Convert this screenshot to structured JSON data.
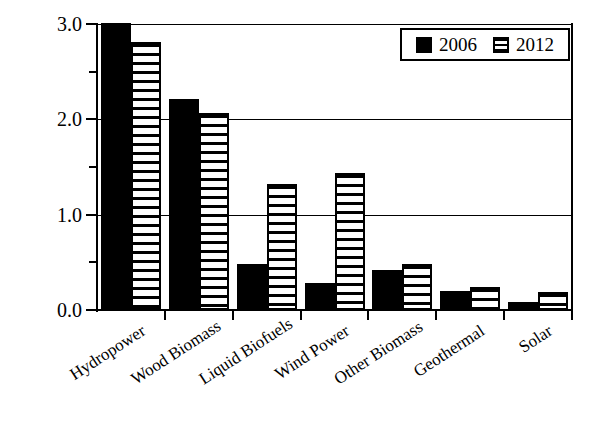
{
  "chart_data": {
    "type": "bar",
    "title": "",
    "xlabel": "",
    "ylabel": "Energy, EJ",
    "ylim": [
      0.0,
      3.0
    ],
    "yticks": [
      "0.0",
      "1.0",
      "2.0",
      "3.0"
    ],
    "ytick_values": [
      0.0,
      1.0,
      2.0,
      3.0
    ],
    "yminor_values": [
      0.5,
      1.5,
      2.5
    ],
    "grid": "horizontal gridlines at 1.0, 2.0, 3.0",
    "legend_position": "upper right, inside axes",
    "categories": [
      "Hydropower",
      "Wood Biomass",
      "Liquid Biofuels",
      "Wind Power",
      "Other Biomass",
      "Geothermal",
      "Solar"
    ],
    "series": [
      {
        "name": "2006",
        "fill": "solid-black",
        "color": "#000000",
        "values": [
          3.01,
          2.21,
          0.48,
          0.28,
          0.42,
          0.2,
          0.08
        ]
      },
      {
        "name": "2012",
        "fill": "horizontal-stripes",
        "color": "#000000",
        "values": [
          2.81,
          2.07,
          1.32,
          1.44,
          0.48,
          0.24,
          0.19
        ]
      }
    ]
  },
  "legend": {
    "entries": [
      {
        "label": "2006",
        "swatch": "solid-black-swatch"
      },
      {
        "label": "2012",
        "swatch": "striped-swatch"
      }
    ]
  },
  "colors": {
    "axis": "#000000",
    "grid": "#000000",
    "background": "#ffffff",
    "series_2006": "#000000",
    "series_2012": "#000000"
  }
}
